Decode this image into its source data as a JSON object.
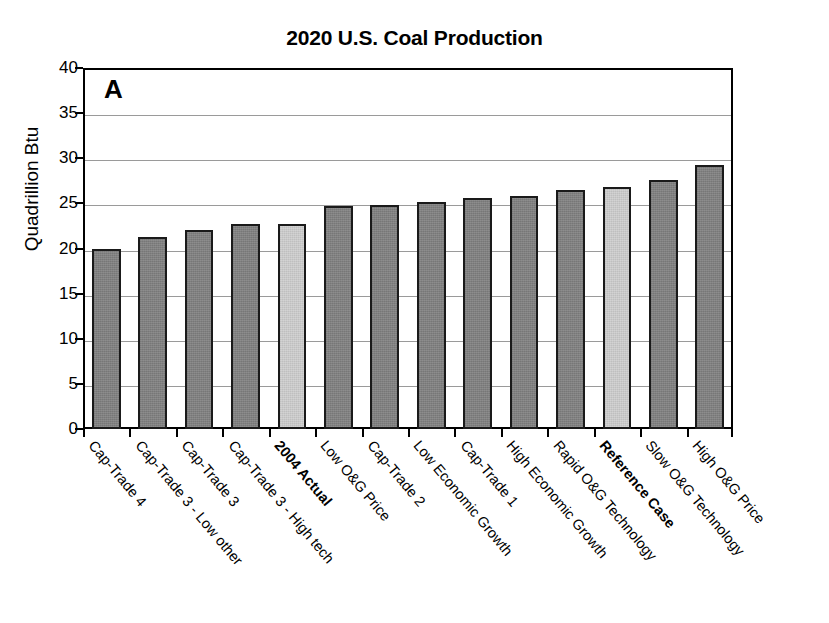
{
  "chart_data": {
    "type": "bar",
    "title": "2020 U.S. Coal Production",
    "panel_label": "A",
    "xlabel": "",
    "ylabel": "Quadrillion Btu",
    "ylim": [
      0,
      40
    ],
    "ytick_values": [
      0,
      5,
      10,
      15,
      20,
      25,
      30,
      35,
      40
    ],
    "ytick_labels": [
      "0",
      "5",
      "10",
      "15",
      "20",
      "25",
      "30",
      "35",
      "40"
    ],
    "grid": true,
    "legend": "none",
    "categories": [
      "Cap-Trade 4",
      "Cap-Trade 3 - Low other",
      "Cap-Trade 3",
      "Cap-Trade 3 - High tech",
      "2004 Actual",
      "Low O&G Price",
      "Cap-Trade 2",
      "Low Economic Growth",
      "Cap-Trade 1",
      "High Economic Growth",
      "Rapid O&G Technology",
      "Reference Case",
      "Slow O&G Technology",
      "High O&G Price"
    ],
    "values": [
      20.0,
      21.3,
      22.0,
      22.7,
      22.7,
      24.7,
      24.8,
      25.1,
      25.6,
      25.8,
      26.5,
      26.8,
      27.6,
      29.2
    ],
    "bar_styles": [
      "dark",
      "dark",
      "dark",
      "dark",
      "light",
      "dark",
      "dark",
      "dark",
      "dark",
      "dark",
      "dark",
      "light",
      "dark",
      "dark"
    ],
    "bold_categories": [
      "2004 Actual",
      "Reference Case"
    ],
    "colors": {
      "bar_dark": "#808080",
      "bar_light": "#c9c9c9",
      "bar_edge": "#1a1a1a",
      "gridline": "#9a9a9a",
      "axis": "#000000",
      "background": "#ffffff"
    }
  }
}
